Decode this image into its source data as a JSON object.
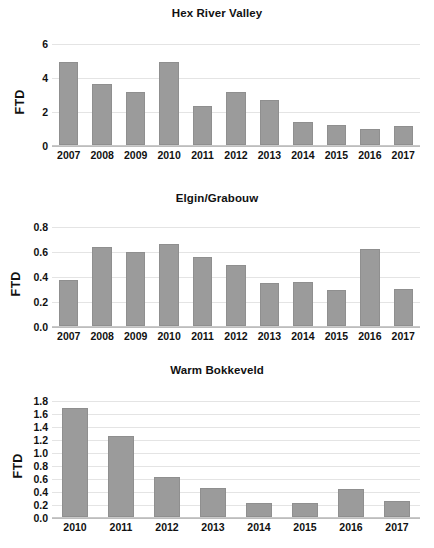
{
  "chart_data": [
    {
      "type": "bar",
      "title": "Hex River Valley",
      "xlabel": "",
      "ylabel": "FTD",
      "ylim": [
        0,
        6
      ],
      "ytick_step": 2,
      "yticks": [
        "0",
        "2",
        "4",
        "6"
      ],
      "grid": true,
      "legend": "none",
      "bar_color": "#9b9b9b",
      "categories": [
        "2007",
        "2008",
        "2009",
        "2010",
        "2011",
        "2012",
        "2013",
        "2014",
        "2015",
        "2016",
        "2017"
      ],
      "values": [
        4.9,
        3.6,
        3.1,
        4.9,
        2.3,
        3.1,
        2.65,
        1.35,
        1.2,
        0.95,
        1.1
      ]
    },
    {
      "type": "bar",
      "title": "Elgin/Grabouw",
      "xlabel": "",
      "ylabel": "FTD",
      "ylim": [
        0,
        0.8
      ],
      "ytick_step": 0.2,
      "yticks": [
        "0.0",
        "0.2",
        "0.4",
        "0.6",
        "0.8"
      ],
      "grid": true,
      "legend": "none",
      "bar_color": "#9b9b9b",
      "categories": [
        "2007",
        "2008",
        "2009",
        "2010",
        "2011",
        "2012",
        "2013",
        "2014",
        "2015",
        "2016",
        "2017"
      ],
      "values": [
        0.37,
        0.635,
        0.59,
        0.655,
        0.55,
        0.485,
        0.345,
        0.355,
        0.285,
        0.615,
        0.295
      ]
    },
    {
      "type": "bar",
      "title": "Warm Bokkeveld",
      "xlabel": "",
      "ylabel": "FTD",
      "ylim": [
        0,
        1.8
      ],
      "ytick_step": 0.2,
      "yticks": [
        "0.0",
        "0.2",
        "0.4",
        "0.6",
        "0.8",
        "1.0",
        "1.2",
        "1.4",
        "1.6",
        "1.8"
      ],
      "grid": true,
      "legend": "none",
      "bar_color": "#9b9b9b",
      "categories": [
        "2010",
        "2011",
        "2012",
        "2013",
        "2014",
        "2015",
        "2016",
        "2017"
      ],
      "values": [
        1.67,
        1.25,
        0.62,
        0.45,
        0.21,
        0.21,
        0.43,
        0.25
      ]
    }
  ]
}
